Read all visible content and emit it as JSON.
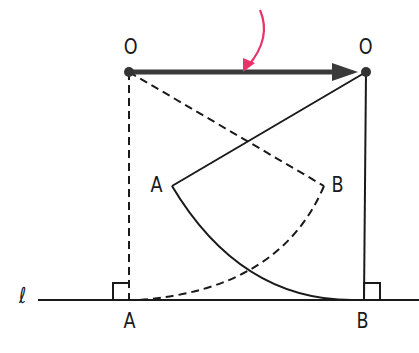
{
  "labels": {
    "o_left": "O",
    "o_right": "O",
    "a_mid": "A",
    "b_mid": "B",
    "a_bottom": "A",
    "b_bottom": "B",
    "line": "ℓ"
  },
  "colors": {
    "ink": "#1a1a1a",
    "arrow_main": "#3a3a3a",
    "pointer": "#e8336a"
  }
}
